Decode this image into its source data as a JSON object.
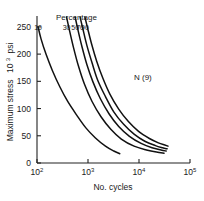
{
  "chart_data": {
    "type": "line",
    "title": "",
    "xlabel": "No. cycles",
    "ylabel_main": "Maximum stress",
    "ylabel_unit_base": "10",
    "ylabel_unit_exp": "3",
    "ylabel_unit_suffix": "psi",
    "xscale": "log",
    "yscale": "linear",
    "xlim": [
      100,
      100000
    ],
    "ylim": [
      0,
      270
    ],
    "grid": false,
    "legend_position": "inside-top (curve labels above each curve)",
    "legend_header": "Percentage",
    "annotation": "N (9)",
    "xticks": [
      {
        "base": "10",
        "exp": "2",
        "value": 100
      },
      {
        "base": "10",
        "exp": "3",
        "value": 1000
      },
      {
        "base": "10",
        "exp": "4",
        "value": 10000
      },
      {
        "base": "10",
        "exp": "5",
        "value": 100000
      }
    ],
    "yticks": [
      "0",
      "50",
      "100",
      "150",
      "200",
      "250"
    ],
    "ytick_values": [
      0,
      50,
      100,
      150,
      200,
      250
    ],
    "series": [
      {
        "name": "10",
        "label": "10",
        "x": [
          105,
          120,
          150,
          200,
          280,
          400,
          600,
          900,
          1400,
          2200,
          3200,
          4200
        ],
        "values": [
          250,
          228,
          200,
          170,
          140,
          113,
          88,
          65,
          46,
          31,
          22,
          17
        ]
      },
      {
        "name": "30",
        "label": "30",
        "x": [
          380,
          430,
          520,
          650,
          850,
          1200,
          1800,
          2800,
          4500,
          8000,
          14000,
          22000,
          31000
        ],
        "values": [
          268,
          245,
          212,
          178,
          145,
          113,
          85,
          62,
          44,
          31,
          24,
          20,
          18
        ]
      },
      {
        "name": "50",
        "label": "50",
        "x": [
          560,
          630,
          760,
          950,
          1250,
          1750,
          2600,
          4000,
          6500,
          11000,
          18000,
          27000,
          34000
        ],
        "values": [
          268,
          246,
          214,
          181,
          149,
          118,
          90,
          67,
          49,
          36,
          28,
          24,
          22
        ]
      },
      {
        "name": "70",
        "label": "70",
        "x": [
          700,
          790,
          950,
          1200,
          1550,
          2200,
          3200,
          5000,
          8000,
          13000,
          21000,
          29000,
          35500
        ],
        "values": [
          268,
          247,
          216,
          184,
          152,
          122,
          94,
          71,
          53,
          40,
          32,
          28,
          26
        ]
      },
      {
        "name": "90",
        "label": "90",
        "x": [
          870,
          980,
          1180,
          1480,
          1950,
          2700,
          4000,
          6200,
          9800,
          16000,
          24000,
          32000,
          37000
        ],
        "values": [
          268,
          248,
          218,
          187,
          156,
          126,
          99,
          76,
          58,
          45,
          37,
          33,
          31
        ]
      }
    ]
  }
}
